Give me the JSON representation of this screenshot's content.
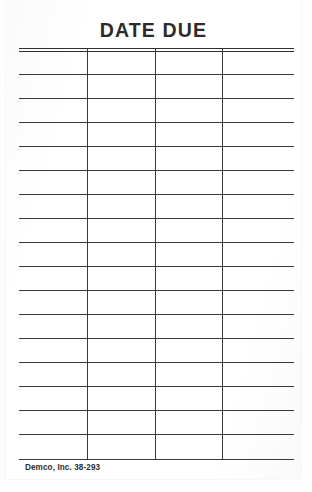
{
  "card": {
    "title": "DATE DUE",
    "imprint": "Demco, Inc. 38-293",
    "kind": "library-date-due-slip",
    "colors": {
      "paper": "#ffffff",
      "ink": "#3a3a3d",
      "title_ink": "#2b2b2d",
      "backdrop": "#fdfdfd"
    }
  },
  "grid": {
    "column_count": 4,
    "row_count": 17,
    "column_dividers_x": [
      68,
      136,
      203
    ],
    "header_double_rule": true,
    "rows": [
      {
        "index": 1,
        "cells": [
          "",
          "",
          "",
          ""
        ]
      },
      {
        "index": 2,
        "cells": [
          "",
          "",
          "",
          ""
        ]
      },
      {
        "index": 3,
        "cells": [
          "",
          "",
          "",
          ""
        ]
      },
      {
        "index": 4,
        "cells": [
          "",
          "",
          "",
          ""
        ]
      },
      {
        "index": 5,
        "cells": [
          "",
          "",
          "",
          ""
        ]
      },
      {
        "index": 6,
        "cells": [
          "",
          "",
          "",
          ""
        ]
      },
      {
        "index": 7,
        "cells": [
          "",
          "",
          "",
          ""
        ]
      },
      {
        "index": 8,
        "cells": [
          "",
          "",
          "",
          ""
        ]
      },
      {
        "index": 9,
        "cells": [
          "",
          "",
          "",
          ""
        ]
      },
      {
        "index": 10,
        "cells": [
          "",
          "",
          "",
          ""
        ]
      },
      {
        "index": 11,
        "cells": [
          "",
          "",
          "",
          ""
        ]
      },
      {
        "index": 12,
        "cells": [
          "",
          "",
          "",
          ""
        ]
      },
      {
        "index": 13,
        "cells": [
          "",
          "",
          "",
          ""
        ]
      },
      {
        "index": 14,
        "cells": [
          "",
          "",
          "",
          ""
        ]
      },
      {
        "index": 15,
        "cells": [
          "",
          "",
          "",
          ""
        ]
      },
      {
        "index": 16,
        "cells": [
          "",
          "",
          "",
          ""
        ]
      },
      {
        "index": 17,
        "cells": [
          "",
          "",
          "",
          ""
        ]
      }
    ],
    "rule_y_positions": [
      2,
      5,
      28,
      52,
      76,
      100,
      124,
      148,
      172,
      196,
      220,
      244,
      268,
      292,
      316,
      340,
      364,
      388,
      413
    ]
  }
}
